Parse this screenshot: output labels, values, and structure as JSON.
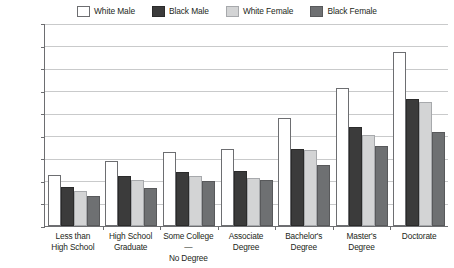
{
  "chart_data": {
    "type": "bar",
    "title": "",
    "subtitle": "",
    "xlabel": "",
    "ylabel": "",
    "ylim": [
      0,
      180000
    ],
    "ytick_step": 20000,
    "grid": true,
    "legend_position": "top-center",
    "ytick_labels": [
      "$180,000",
      "$160,000",
      "$140,000",
      "$120,000",
      "$100,000",
      "$80,000",
      "$60,000",
      "$40,000",
      "$20,000",
      "$0"
    ],
    "ytick_values": [
      180000,
      160000,
      140000,
      120000,
      100000,
      80000,
      60000,
      40000,
      20000,
      0
    ],
    "categories": [
      "Less than\nHigh School",
      "High School\nGraduate",
      "Some College—\nNo Degree",
      "Associate\nDegree",
      "Bachelor's\nDegree",
      "Master's\nDegree",
      "Doctorate"
    ],
    "series": [
      {
        "name": "White Male",
        "color": "#ffffff",
        "values": [
          45000,
          58000,
          66000,
          68000,
          96000,
          122000,
          154000
        ]
      },
      {
        "name": "Black Male",
        "color": "#3b3b3b",
        "values": [
          35000,
          44000,
          48000,
          49000,
          68000,
          88000,
          113000
        ]
      },
      {
        "name": "White Female",
        "color": "#d3d4d5",
        "values": [
          31000,
          41000,
          44000,
          43000,
          67000,
          81000,
          110000
        ]
      },
      {
        "name": "Black Female",
        "color": "#6e7072",
        "values": [
          27000,
          34000,
          40000,
          41000,
          54000,
          71000,
          83000
        ]
      }
    ]
  },
  "legend": {
    "items": [
      {
        "label": "White Male",
        "color": "#ffffff",
        "border": "#6d6e71"
      },
      {
        "label": "Black Male",
        "color": "#3b3b3b",
        "border": "#2b2b2b"
      },
      {
        "label": "White Female",
        "color": "#d3d4d5",
        "border": "#a7a9ac"
      },
      {
        "label": "Black Female",
        "color": "#6e7072",
        "border": "#58595b"
      }
    ]
  },
  "axis_colors": {
    "axis_line": "#6d6e71",
    "gridline": "#c9cacb",
    "text": "#231f20"
  }
}
